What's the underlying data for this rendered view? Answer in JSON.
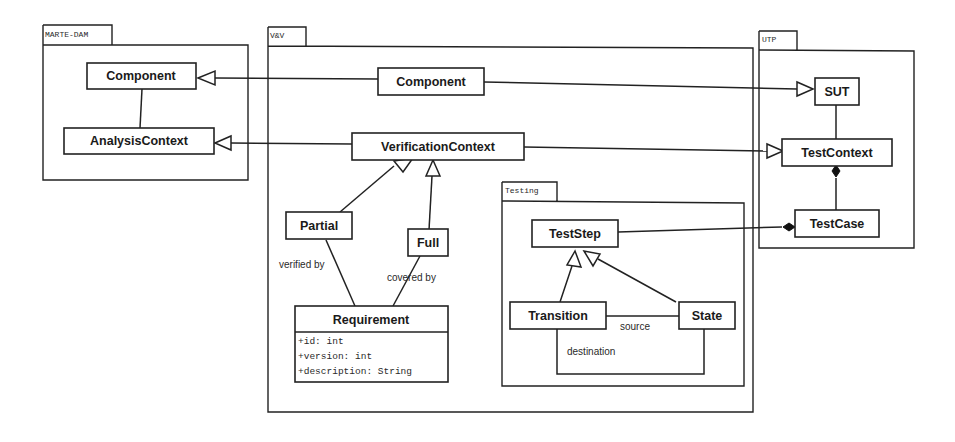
{
  "packages": {
    "marte_dam": "MARTE-DAM",
    "vv": "V&V",
    "utp": "UTP",
    "testing": "Testing"
  },
  "classes": {
    "marte_component": "Component",
    "analysis_context": "AnalysisContext",
    "vv_component": "Component",
    "verification_context": "VerificationContext",
    "partial": "Partial",
    "full": "Full",
    "requirement": "Requirement",
    "sut": "SUT",
    "test_context": "TestContext",
    "test_case": "TestCase",
    "test_step": "TestStep",
    "transition": "Transition",
    "state": "State"
  },
  "requirement_attributes": [
    "+id: int",
    "+version: int",
    "+description: String"
  ],
  "association_labels": {
    "verified_by": "verified by",
    "covered_by": "covered by",
    "source": "source",
    "destination": "destination"
  }
}
